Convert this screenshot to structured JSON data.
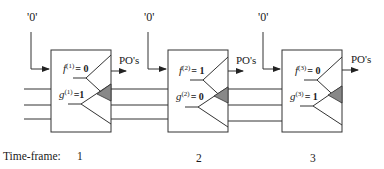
{
  "figure": {
    "type": "time-frame expansion diagram",
    "colors": {
      "line": "#333333",
      "shaded_triangle": "#888888",
      "background": "#ffffff"
    }
  },
  "frames": [
    {
      "index": 1,
      "input_label": "'0'",
      "output_label": "PO's",
      "f_var": "f",
      "f_sup": "(1)",
      "f_eq": "= 0",
      "g_var": "g",
      "g_sup": "(1)",
      "g_eq": "=1"
    },
    {
      "index": 2,
      "input_label": "'0'",
      "output_label": "PO's",
      "f_var": "f",
      "f_sup": "(2)",
      "f_eq": "= 1",
      "g_var": "g",
      "g_sup": "(2)",
      "g_eq": "= 0"
    },
    {
      "index": 3,
      "input_label": "'0'",
      "output_label": "PO's",
      "f_var": "f",
      "f_sup": "(3)",
      "f_eq": "= 0",
      "g_var": "g",
      "g_sup": "(3)",
      "g_eq": "= 1"
    }
  ],
  "timeline": {
    "label": "Time-frame:",
    "ticks": [
      "1",
      "2",
      "3"
    ]
  }
}
